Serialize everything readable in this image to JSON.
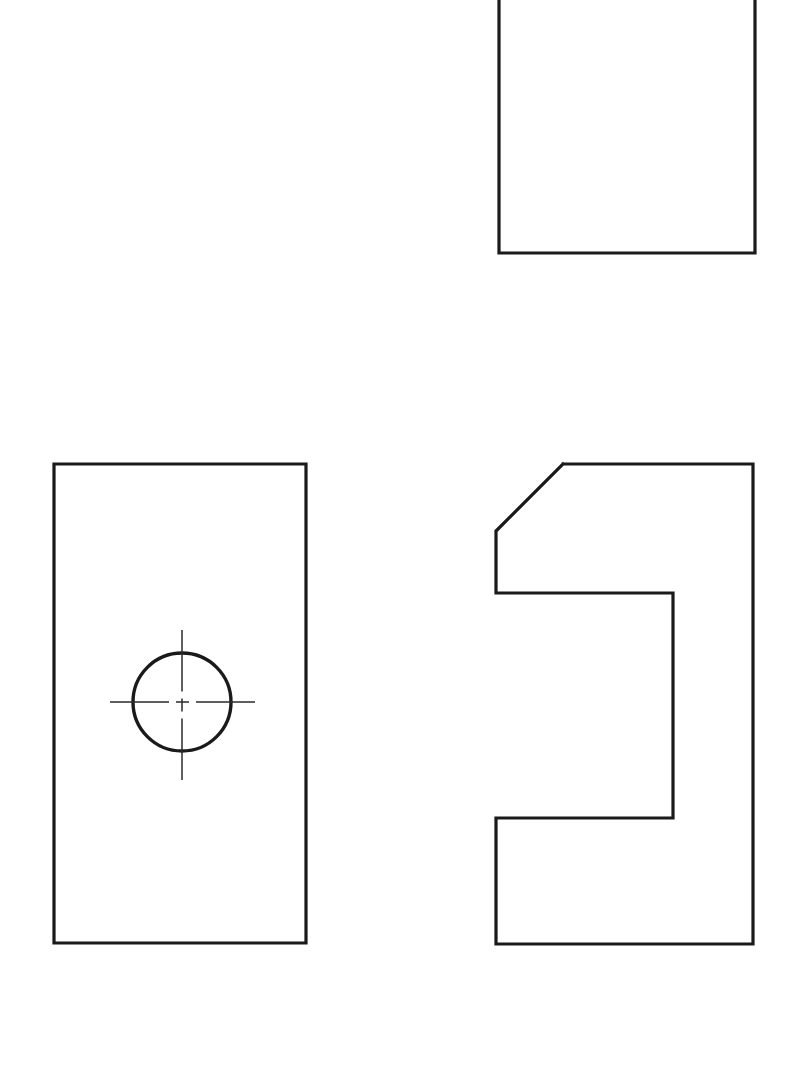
{
  "sheet": {
    "title": "Orthographic Multiview Drawing",
    "width": 798,
    "height": 1077,
    "background_color": "#ffffff",
    "line_color": "#1a1a1a",
    "centerline_color": "#2b2b2b",
    "projection": "third-angle multiview",
    "view_count": 3
  },
  "views": {
    "top": {
      "label": "top-view",
      "shape": "rectangle",
      "clipped_at_sheet_top": true,
      "left": 499,
      "right": 755,
      "top": -30,
      "bottom": 253,
      "width": 256,
      "visible_height": 283,
      "outline_points": "499,-30 755,-30 755,253 499,253 499,-30"
    },
    "front": {
      "label": "front-view",
      "shape": "rectangle-with-hole",
      "left": 54,
      "right": 306,
      "top": 464,
      "bottom": 943,
      "width": 252,
      "height": 479,
      "outline_points": "54,464 306,464 306,943 54,943 54,464",
      "hole": {
        "label": "drilled-hole",
        "center_x": 182,
        "center_y": 702,
        "radius": 49,
        "diameter": 98
      },
      "centerlines": {
        "style": "dash-dot",
        "horizontal": {
          "x1": 110,
          "x2": 255,
          "y": 702
        },
        "vertical": {
          "y1": 630,
          "y2": 780,
          "x": 182
        }
      }
    },
    "side": {
      "label": "side-view",
      "shape": "c-profile-with-chamfer",
      "left": 496,
      "right": 753,
      "top": 464,
      "bottom": 944,
      "width": 257,
      "height": 480,
      "outline_points": "563,464 753,464 753,944 496,944 496,818 673,818 673,593 496,593 496,531 563,464",
      "chamfer": {
        "label": "chamfer-top-left",
        "from_x": 563,
        "from_y": 464,
        "to_x": 496,
        "to_y": 531,
        "run": 67,
        "rise": 67,
        "angle_deg": 45
      },
      "notch": {
        "label": "rectangular-notch",
        "opening_side": "left",
        "depth": 177,
        "height": 225,
        "top_y": 593,
        "bottom_y": 818,
        "inner_x": 673,
        "outer_x": 496
      }
    }
  }
}
